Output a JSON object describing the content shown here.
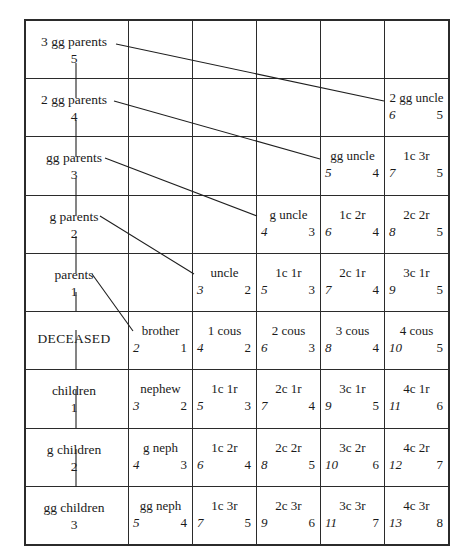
{
  "chart": {
    "ego_label": "DECEASED",
    "grid": {
      "rows": 9,
      "cols": 6
    },
    "number_legend": {
      "left_number_meaning": "civil law degree",
      "right_number_meaning": "canon law degree"
    }
  },
  "columns": [
    {
      "key": "lineal",
      "header": "direct line"
    },
    {
      "key": "collat1",
      "header": "1st collateral line"
    },
    {
      "key": "collat2",
      "header": "2nd collateral line"
    },
    {
      "key": "collat3",
      "header": "3rd collateral line"
    },
    {
      "key": "collat4",
      "header": "4th collateral line"
    },
    {
      "key": "collat5",
      "header": "5th collateral line"
    }
  ],
  "rows": [
    {
      "lineal": {
        "label": "3 gg parents",
        "num": "5"
      },
      "cells": [
        {
          "name": "",
          "left": "",
          "right": ""
        },
        {
          "name": "",
          "left": "",
          "right": ""
        },
        {
          "name": "",
          "left": "",
          "right": ""
        },
        {
          "name": "",
          "left": "",
          "right": ""
        },
        {
          "name": "",
          "left": "",
          "right": ""
        }
      ]
    },
    {
      "lineal": {
        "label": "2 gg parents",
        "num": "4"
      },
      "cells": [
        {
          "name": "",
          "left": "",
          "right": ""
        },
        {
          "name": "",
          "left": "",
          "right": ""
        },
        {
          "name": "",
          "left": "",
          "right": ""
        },
        {
          "name": "",
          "left": "",
          "right": ""
        },
        {
          "name": "2 gg uncle",
          "left": "6",
          "right": "5"
        }
      ]
    },
    {
      "lineal": {
        "label": "gg parents",
        "num": "3"
      },
      "cells": [
        {
          "name": "",
          "left": "",
          "right": ""
        },
        {
          "name": "",
          "left": "",
          "right": ""
        },
        {
          "name": "",
          "left": "",
          "right": ""
        },
        {
          "name": "gg uncle",
          "left": "5",
          "right": "4"
        },
        {
          "name": "1c 3r",
          "left": "7",
          "right": "5"
        }
      ]
    },
    {
      "lineal": {
        "label": "g parents",
        "num": "2"
      },
      "cells": [
        {
          "name": "",
          "left": "",
          "right": ""
        },
        {
          "name": "",
          "left": "",
          "right": ""
        },
        {
          "name": "g uncle",
          "left": "4",
          "right": "3"
        },
        {
          "name": "1c 2r",
          "left": "6",
          "right": "4"
        },
        {
          "name": "2c 2r",
          "left": "8",
          "right": "5"
        }
      ]
    },
    {
      "lineal": {
        "label": "parents",
        "num": "1"
      },
      "cells": [
        {
          "name": "",
          "left": "",
          "right": ""
        },
        {
          "name": "uncle",
          "left": "3",
          "right": "2"
        },
        {
          "name": "1c 1r",
          "left": "5",
          "right": "3"
        },
        {
          "name": "2c 1r",
          "left": "7",
          "right": "4"
        },
        {
          "name": "3c 1r",
          "left": "9",
          "right": "5"
        }
      ]
    },
    {
      "lineal": {
        "label": "DECEASED",
        "num": ""
      },
      "cells": [
        {
          "name": "brother",
          "left": "2",
          "right": "1"
        },
        {
          "name": "1 cous",
          "left": "4",
          "right": "2"
        },
        {
          "name": "2 cous",
          "left": "6",
          "right": "3"
        },
        {
          "name": "3 cous",
          "left": "8",
          "right": "4"
        },
        {
          "name": "4 cous",
          "left": "10",
          "right": "5"
        }
      ]
    },
    {
      "lineal": {
        "label": "children",
        "num": "1"
      },
      "cells": [
        {
          "name": "nephew",
          "left": "3",
          "right": "2"
        },
        {
          "name": "1c 1r",
          "left": "5",
          "right": "3"
        },
        {
          "name": "2c 1r",
          "left": "7",
          "right": "4"
        },
        {
          "name": "3c 1r",
          "left": "9",
          "right": "5"
        },
        {
          "name": "4c 1r",
          "left": "11",
          "right": "6"
        }
      ]
    },
    {
      "lineal": {
        "label": "g children",
        "num": "2"
      },
      "cells": [
        {
          "name": "g neph",
          "left": "4",
          "right": "3"
        },
        {
          "name": "1c 2r",
          "left": "6",
          "right": "4"
        },
        {
          "name": "2c 2r",
          "left": "8",
          "right": "5"
        },
        {
          "name": "3c 2r",
          "left": "10",
          "right": "6"
        },
        {
          "name": "4c 2r",
          "left": "12",
          "right": "7"
        }
      ]
    },
    {
      "lineal": {
        "label": "gg children",
        "num": "3"
      },
      "cells": [
        {
          "name": "gg neph",
          "left": "5",
          "right": "4"
        },
        {
          "name": "1c 3r",
          "left": "7",
          "right": "5"
        },
        {
          "name": "2c 3r",
          "left": "9",
          "right": "6"
        },
        {
          "name": "3c 3r",
          "left": "11",
          "right": "7"
        },
        {
          "name": "4c 3r",
          "left": "13",
          "right": "8"
        }
      ]
    }
  ],
  "connectors": {
    "description": "diagonal leader lines from each ancestor generation to its collateral branch",
    "lines": [
      {
        "from": "3 gg parents",
        "to": "2 gg uncle"
      },
      {
        "from": "2 gg parents",
        "to": "gg uncle"
      },
      {
        "from": "gg parents",
        "to": "g uncle"
      },
      {
        "from": "g parents",
        "to": "uncle"
      },
      {
        "from": "parents",
        "to": "brother"
      }
    ],
    "spine": {
      "description": "vertical direct-line spine through column 1",
      "from": "3 gg parents",
      "to": "gg children"
    }
  },
  "colors": {
    "ink": "#1f1f1f",
    "rule": "#2b2b2b",
    "paper": "#ffffff"
  }
}
